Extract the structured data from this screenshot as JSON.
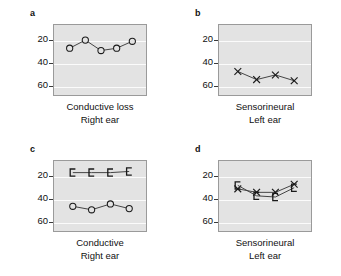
{
  "figure": {
    "background": "#ffffff",
    "plot_background": "#e3e3e3",
    "gridline_color": "#fbfbfb",
    "axis_color": "#9a9a9a",
    "marker_color": "#1a1a1a",
    "line_color": "#3c3c3c"
  },
  "chart_data": [
    {
      "type": "line",
      "panel": "a",
      "title": "a",
      "xlabel_line1": "Conductive loss",
      "xlabel_line2": "Right ear",
      "ylabel": "",
      "yticks": [
        20,
        40,
        60
      ],
      "ylim": [
        10,
        72
      ],
      "y_inverted": true,
      "xlim": [
        0,
        6
      ],
      "grid": true,
      "legend": "none",
      "series": [
        {
          "name": "Conductive loss right ear",
          "marker": "circle",
          "x": [
            1,
            2,
            3,
            4,
            5
          ],
          "values": [
            30,
            23,
            32,
            30,
            24
          ]
        }
      ]
    },
    {
      "type": "line",
      "panel": "b",
      "title": "b",
      "xlabel_line1": "Sensorineural",
      "xlabel_line2": "Left ear",
      "ylabel": "",
      "yticks": [
        20,
        40,
        60
      ],
      "ylim": [
        10,
        72
      ],
      "y_inverted": true,
      "xlim": [
        0,
        5
      ],
      "grid": true,
      "legend": "none",
      "series": [
        {
          "name": "Sensorineural left ear",
          "marker": "cross",
          "x": [
            1,
            2,
            3,
            4
          ],
          "values": [
            50,
            57,
            53,
            58
          ]
        }
      ]
    },
    {
      "type": "line",
      "panel": "c",
      "title": "c",
      "xlabel_line1": "Conductive",
      "xlabel_line2": "Right ear",
      "ylabel": "",
      "yticks": [
        20,
        40,
        60
      ],
      "ylim": [
        10,
        72
      ],
      "y_inverted": true,
      "xlim": [
        0,
        5
      ],
      "grid": true,
      "legend": "none",
      "series": [
        {
          "name": "Bone conduction right ear",
          "marker": "bracket",
          "x": [
            1,
            2,
            3,
            4
          ],
          "values": [
            20,
            20,
            20,
            19
          ]
        },
        {
          "name": "Air conduction right ear",
          "marker": "circle",
          "x": [
            1,
            2,
            3,
            4
          ],
          "values": [
            49,
            52,
            47,
            51
          ]
        }
      ]
    },
    {
      "type": "line",
      "panel": "d",
      "title": "d",
      "xlabel_line1": "Sensorineural",
      "xlabel_line2": "Left ear",
      "ylabel": "",
      "yticks": [
        20,
        40,
        60
      ],
      "ylim": [
        10,
        72
      ],
      "y_inverted": true,
      "xlim": [
        0,
        5
      ],
      "grid": true,
      "legend": "none",
      "series": [
        {
          "name": "Air conduction left ear",
          "marker": "cross",
          "x": [
            1,
            2,
            3,
            4
          ],
          "values": [
            34,
            37,
            37,
            30
          ]
        },
        {
          "name": "Bone conduction left ear",
          "marker": "bracket",
          "x": [
            1,
            2,
            3,
            4
          ],
          "values": [
            31,
            40,
            41,
            33
          ]
        }
      ]
    }
  ],
  "panels": {
    "a": {
      "letter": "a",
      "caption_line1": "Conductive loss",
      "caption_line2": "Right ear",
      "ytick_labels": [
        "20",
        "40",
        "60"
      ]
    },
    "b": {
      "letter": "b",
      "caption_line1": "Sensorineural",
      "caption_line2": "Left ear",
      "ytick_labels": [
        "20",
        "40",
        "60"
      ]
    },
    "c": {
      "letter": "c",
      "caption_line1": "Conductive",
      "caption_line2": "Right ear",
      "ytick_labels": [
        "20",
        "40",
        "60"
      ]
    },
    "d": {
      "letter": "d",
      "caption_line1": "Sensorineural",
      "caption_line2": "Left ear",
      "ytick_labels": [
        "20",
        "40",
        "60"
      ]
    }
  }
}
